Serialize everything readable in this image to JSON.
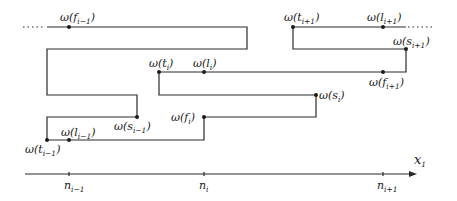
{
  "diagram": {
    "title": "",
    "axis": {
      "label": "x",
      "label_sub": "1",
      "ticks": [
        {
          "base": "n",
          "sub": "i−1"
        },
        {
          "base": "n",
          "sub": "i"
        },
        {
          "base": "n",
          "sub": "i+1"
        }
      ]
    },
    "points": [
      {
        "fn": "ω(",
        "var": "f",
        "sub": "i−1",
        "close": ")"
      },
      {
        "fn": "ω(",
        "var": "t",
        "sub": "i+1",
        "close": ")"
      },
      {
        "fn": "ω(",
        "var": "l",
        "sub": "i+1",
        "close": ")"
      },
      {
        "fn": "ω(",
        "var": "s",
        "sub": "i+1",
        "close": ")"
      },
      {
        "fn": "ω(",
        "var": "t",
        "sub": "i",
        "close": ")"
      },
      {
        "fn": "ω(",
        "var": "l",
        "sub": "i",
        "close": ")"
      },
      {
        "fn": "ω(",
        "var": "f",
        "sub": "i+1",
        "close": ")"
      },
      {
        "fn": "ω(",
        "var": "s",
        "sub": "i",
        "close": ")"
      },
      {
        "fn": "ω(",
        "var": "f",
        "sub": "i",
        "close": ")"
      },
      {
        "fn": "ω(",
        "var": "s",
        "sub": "i−1",
        "close": ")"
      },
      {
        "fn": "ω(",
        "var": "l",
        "sub": "i−1",
        "close": ")"
      },
      {
        "fn": "ω(",
        "var": "t",
        "sub": "i−1",
        "close": ")"
      }
    ],
    "continuation": "·····"
  }
}
